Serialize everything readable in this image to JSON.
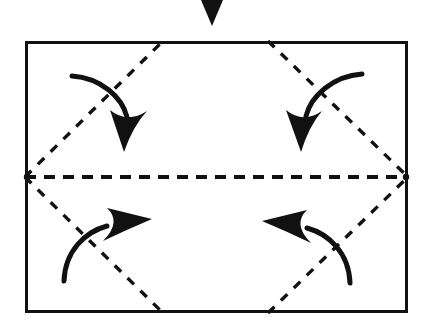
{
  "figure": {
    "kind": "origami-fold-diagram",
    "background_color": "#ffffff",
    "ink_color": "#111111",
    "canvas": {
      "width": 427,
      "height": 330
    }
  },
  "paper": {
    "name": "rectangular-sheet",
    "shape": "rectangle",
    "stroke_color": "#111111",
    "stroke_width": 3,
    "fill": "#ffffff",
    "x": 25,
    "y": 41,
    "width": 383,
    "height": 272,
    "left": 25,
    "top": 41,
    "right": 408,
    "bottom": 313
  },
  "fold_lines": {
    "stroke_color": "#111111",
    "style": "dashed",
    "items": [
      {
        "name": "center-horizontal-fold-line",
        "label": "horizontal center crease",
        "x1": 25,
        "y1": 177,
        "x2": 408,
        "y2": 177,
        "dash": "11 8",
        "stroke_width": 4
      },
      {
        "name": "fold-line-top-left-diagonal",
        "label": "top-left diagonal crease",
        "x1": 25,
        "y1": 177,
        "x2": 163,
        "y2": 41,
        "dash": "9 9",
        "stroke_width": 3.4
      },
      {
        "name": "fold-line-top-right-diagonal",
        "label": "top-right diagonal crease",
        "x1": 268,
        "y1": 41,
        "x2": 408,
        "y2": 177,
        "dash": "9 9",
        "stroke_width": 3.4
      },
      {
        "name": "fold-line-bottom-left-diagonal",
        "label": "bottom-left diagonal crease",
        "x1": 25,
        "y1": 177,
        "x2": 163,
        "y2": 313,
        "dash": "9 9",
        "stroke_width": 3.4
      },
      {
        "name": "fold-line-bottom-right-diagonal",
        "label": "bottom-right diagonal crease",
        "x1": 268,
        "y1": 313,
        "x2": 408,
        "y2": 177,
        "dash": "9 9",
        "stroke_width": 3.4
      }
    ]
  },
  "vertices": {
    "left_point": {
      "name": "left-fold-vertex",
      "x": 25,
      "y": 177
    },
    "right_point": {
      "name": "right-fold-vertex",
      "x": 408,
      "y": 177
    },
    "top_left_point": {
      "name": "top-left-crease-point",
      "x": 163,
      "y": 41
    },
    "top_right_point": {
      "name": "top-right-crease-point",
      "x": 268,
      "y": 41
    },
    "bottom_left_point": {
      "name": "bottom-left-crease-point",
      "x": 163,
      "y": 313
    },
    "bottom_right_point": {
      "name": "bottom-right-crease-point",
      "x": 268,
      "y": 313
    }
  },
  "pointer_arrow": {
    "name": "top-pointer-triangle",
    "label": "solid triangle pointer above sheet",
    "shape": "filled-triangle-down",
    "fill": "#111111",
    "apex_x": 212,
    "apex_y": 26,
    "left_x": 201,
    "left_y": 0,
    "right_x": 223,
    "right_y": 0
  },
  "curved_arrows": {
    "stroke_color": "#111111",
    "stroke_width": 5,
    "head_fill": "#111111",
    "items": [
      {
        "name": "fold-arrow-top-left",
        "label": "fold down left top flap",
        "direction": "down",
        "path": "M 72,76 C 100,78 122,98 128,120",
        "head": "123,151 110,112 129,121 148,112",
        "start": {
          "x": 72,
          "y": 76
        },
        "end": {
          "x": 128,
          "y": 120
        }
      },
      {
        "name": "fold-arrow-top-right",
        "label": "fold down right top flap",
        "direction": "down",
        "path": "M 362,74 C 333,76 310,97 304,119",
        "head": "299,152 285,112 304,120, 323,112",
        "start": {
          "x": 362,
          "y": 74
        },
        "end": {
          "x": 304,
          "y": 119
        }
      },
      {
        "name": "fold-arrow-bottom-left",
        "label": "fold up left bottom flap",
        "direction": "up-right",
        "path": "M 64,281 C 66,252 86,233 108,226",
        "head": "142,221 103,208 111,227 103,246",
        "start": {
          "x": 64,
          "y": 281
        },
        "end": {
          "x": 108,
          "y": 226
        }
      },
      {
        "name": "fold-arrow-bottom-right",
        "label": "fold up right bottom flap",
        "direction": "up-left",
        "path": "M 350,283 C 348,254 328,234 306,227",
        "head": "271,222 311,209 303,228 311,247",
        "start": {
          "x": 350,
          "y": 283
        },
        "end": {
          "x": 306,
          "y": 227
        }
      }
    ]
  }
}
